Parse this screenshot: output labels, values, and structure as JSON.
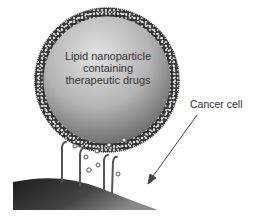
{
  "labels": {
    "nanoparticle_line1": "Lipid nanoparticle",
    "nanoparticle_line2": "containing",
    "nanoparticle_line3": "therapeutic drugs",
    "cancer_cell": "Cancer cell"
  },
  "colors": {
    "background": "#ffffff",
    "sphere_light": "#dcdcdc",
    "sphere_dark": "#6e6e6e",
    "membrane": "#3a3a3a",
    "cell_surface": "#2a2a2a",
    "arrow": "#444444"
  }
}
